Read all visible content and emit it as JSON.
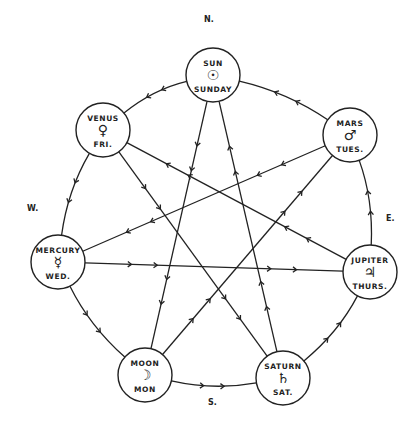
{
  "diagram": {
    "type": "heptagram planetary days diagram",
    "directions": {
      "north": "N.",
      "south": "S.",
      "east": "E.",
      "west": "W."
    },
    "nodes": [
      {
        "id": "sun",
        "name": "SUN",
        "symbol": "☉",
        "day": "SUNDAY",
        "x": 213,
        "y": 75
      },
      {
        "id": "venus",
        "name": "VENUS",
        "symbol": "♀",
        "day": "FRI.",
        "x": 103,
        "y": 130
      },
      {
        "id": "mars",
        "name": "MARS",
        "symbol": "♂",
        "day": "TUES.",
        "x": 350,
        "y": 135
      },
      {
        "id": "mercury",
        "name": "MERCURY",
        "symbol": "☿",
        "day": "WED.",
        "x": 58,
        "y": 262
      },
      {
        "id": "jupiter",
        "name": "JUPITER",
        "symbol": "♃",
        "day": "THURS.",
        "x": 370,
        "y": 272
      },
      {
        "id": "moon",
        "name": "MOON",
        "symbol": "☽",
        "day": "MON",
        "x": 145,
        "y": 375
      },
      {
        "id": "saturn",
        "name": "SATURN",
        "symbol": "♄",
        "day": "SAT.",
        "x": 283,
        "y": 378
      }
    ],
    "outer_cycle": [
      "mars",
      "sun",
      "venus",
      "mercury",
      "moon",
      "saturn",
      "jupiter",
      "mars"
    ],
    "star_cycle": [
      "sun",
      "moon",
      "mars",
      "mercury",
      "jupiter",
      "venus",
      "saturn",
      "sun"
    ],
    "line_color": "#222222"
  }
}
